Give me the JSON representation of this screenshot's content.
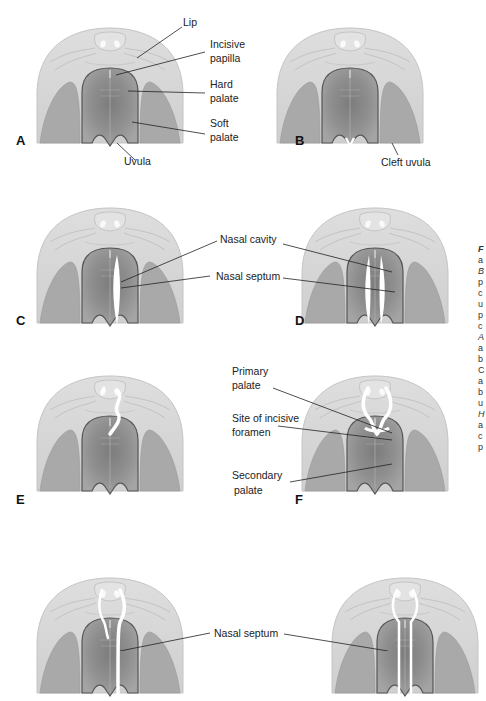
{
  "figure": {
    "panels": [
      {
        "letter": "A",
        "variant": "normal"
      },
      {
        "letter": "B",
        "variant": "cleft-uvula"
      },
      {
        "letter": "C",
        "variant": "unilateral-cleft"
      },
      {
        "letter": "D",
        "variant": "bilateral-cleft"
      },
      {
        "letter": "E",
        "variant": "unilateral-primary-cleft"
      },
      {
        "letter": "F",
        "variant": "bilateral-primary-cleft"
      },
      {
        "letter": "G",
        "variant": "combined-unilateral"
      },
      {
        "letter": "H",
        "variant": "combined-bilateral"
      }
    ],
    "labels": {
      "lip": "Lip",
      "incisive_papilla_1": "Incisive",
      "incisive_papilla_2": "papilla",
      "hard_palate_1": "Hard",
      "hard_palate_2": "palate",
      "soft_palate_1": "Soft",
      "soft_palate_2": "palate",
      "uvula": "Uvula",
      "cleft_uvula": "Cleft uvula",
      "nasal_cavity": "Nasal cavity",
      "nasal_septum": "Nasal septum",
      "primary_palate_1": "Primary",
      "primary_palate_2": "palate",
      "incisive_foramen_1": "Site of incisive",
      "incisive_foramen_2": "foramen",
      "secondary_palate_1": "Secondary",
      "secondary_palate_2": "palate",
      "nasal_septum_bottom": "Nasal septum"
    },
    "caption_fragments": [
      "F",
      "a",
      "B",
      "p",
      "c",
      "u",
      "p",
      "c",
      "A",
      "a",
      "b",
      "C",
      "a",
      "b",
      "u",
      "H",
      "a",
      "c",
      "p"
    ]
  },
  "colors": {
    "background": "#ffffff",
    "lip": "#d6d6d6",
    "cheek": "#a9a9a9",
    "palate_dark": "#6e6e6e",
    "palate_light": "#9a9a9a",
    "cleft": "#ffffff",
    "text": "#222222"
  }
}
